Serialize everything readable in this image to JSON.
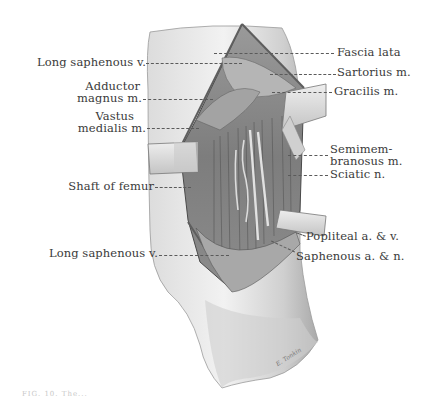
{
  "figure": {
    "type": "anatomical-illustration",
    "style": "grayscale pencil drawing",
    "colors": {
      "background": "#ffffff",
      "skin_light": "#e6e6e6",
      "skin_mid": "#bdbdbd",
      "shadow": "#6e6e6e",
      "retractor": "#d9d9d9",
      "label_text": "#3a3a3a"
    },
    "labels_left": [
      {
        "text": "Long saphenous v.",
        "y": 62
      },
      {
        "text": "Adductor",
        "y": 87
      },
      {
        "text": "magnus m.",
        "y": 99
      },
      {
        "text": "Vastus",
        "y": 116
      },
      {
        "text": "medialis m.",
        "y": 128
      },
      {
        "text": "Shaft of femur",
        "y": 186
      },
      {
        "text": "Long saphenous v.",
        "y": 253
      }
    ],
    "labels_right": [
      {
        "text": "Fascia lata",
        "y": 52
      },
      {
        "text": "Sartorius m.",
        "y": 72
      },
      {
        "text": "Gracilis m.",
        "y": 91
      },
      {
        "text": "Semimem-",
        "y": 149
      },
      {
        "text": "branosus m.",
        "y": 161
      },
      {
        "text": "Sciatic n.",
        "y": 174
      },
      {
        "text": "Popliteal a. & v.",
        "y": 236
      },
      {
        "text": "Saphenous a. & n.",
        "y": 256
      }
    ],
    "signature": "E. Tonkin",
    "caption": "FIG. 10. The..."
  }
}
